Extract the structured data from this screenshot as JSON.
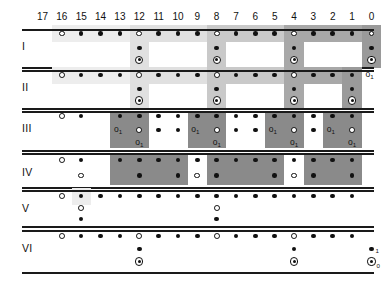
{
  "figure": {
    "title": "",
    "columns": [
      17,
      16,
      15,
      14,
      13,
      12,
      11,
      10,
      9,
      8,
      7,
      6,
      5,
      4,
      3,
      2,
      1,
      0
    ],
    "row_labels": [
      "I",
      "II",
      "III",
      "IV",
      "V",
      "VI"
    ],
    "legend_marks": {
      "filled": "•",
      "open": "○",
      "bullseye": "⊙"
    },
    "annotations": {
      "o_sub1": "o",
      "sub_1": "1",
      "sub_0": "0",
      "dot_sub1_row6": "•",
      "bull_sub0_row6": "⊙"
    },
    "colors": {
      "ink": "#111111",
      "shade_1": "#ededed",
      "shade_2": "#e0e0e0",
      "shade_3": "#c9c9c9",
      "shade_4": "#a8a8a8",
      "shade_5": "#9a9a9a",
      "shade_dark": "#8a8a8a",
      "background": "#ffffff"
    }
  },
  "rows": [
    {
      "id": "I",
      "label": "I",
      "top_dots": {
        "open_cols": [
          16,
          12,
          8,
          4,
          0
        ],
        "filled_cols": [
          15,
          14,
          13,
          11,
          10,
          9,
          7,
          6,
          5,
          3,
          2,
          1
        ]
      },
      "tails": [
        {
          "col": 12,
          "marks": [
            "filled",
            "bullseye"
          ]
        },
        {
          "col": 8,
          "marks": [
            "filled",
            "bullseye"
          ]
        },
        {
          "col": 4,
          "marks": [
            "filled",
            "bullseye"
          ]
        },
        {
          "col": 0,
          "marks": [
            "filled",
            "bullseye"
          ]
        }
      ],
      "bands": [
        {
          "from": 16,
          "to": 13,
          "shade": "shade_1"
        },
        {
          "from": 12,
          "to": 9,
          "shade": "shade_2"
        },
        {
          "from": 8,
          "to": 5,
          "shade": "shade_3"
        },
        {
          "from": 4,
          "to": 1,
          "shade": "shade_4"
        },
        {
          "from": 0,
          "to": 0,
          "shade": "shade_5"
        }
      ]
    },
    {
      "id": "II",
      "label": "II",
      "top_dots": {
        "open_cols": [
          16,
          12,
          8,
          4
        ],
        "filled_cols": [
          15,
          14,
          13,
          11,
          10,
          9,
          7,
          6,
          5,
          3,
          2,
          1
        ]
      },
      "tails": [
        {
          "col": 12,
          "marks": [
            "filled",
            "bullseye"
          ]
        },
        {
          "col": 8,
          "marks": [
            "filled",
            "bullseye"
          ]
        },
        {
          "col": 4,
          "marks": [
            "filled",
            "bullseye"
          ]
        },
        {
          "col": 1,
          "marks": [
            "filled",
            "bullseye"
          ]
        }
      ],
      "bands": [
        {
          "from": 16,
          "to": 13,
          "shade": "shade_1"
        },
        {
          "from": 12,
          "to": 9,
          "shade": "shade_2"
        },
        {
          "from": 8,
          "to": 5,
          "shade": "shade_3"
        },
        {
          "from": 4,
          "to": 2,
          "shade": "shade_4"
        },
        {
          "from": 1,
          "to": 1,
          "shade": "shade_5"
        }
      ],
      "edge_note": {
        "col": 0,
        "text": "o",
        "sub": "1"
      }
    },
    {
      "id": "III",
      "label": "III",
      "top_dots": {
        "open_cols": [
          16
        ],
        "filled_cols": [
          15,
          13,
          12,
          11,
          10,
          9,
          8,
          7,
          6,
          5,
          4,
          3,
          2,
          1
        ]
      },
      "blocks": [
        {
          "from": 13,
          "to": 12,
          "shade": "shade_dark"
        },
        {
          "from": 9,
          "to": 8,
          "shade": "shade_dark"
        },
        {
          "from": 5,
          "to": 4,
          "shade": "shade_dark"
        },
        {
          "from": 2,
          "to": 1,
          "shade": "shade_dark"
        }
      ],
      "mid_filled_cols": [
        11,
        10,
        7,
        6,
        3
      ],
      "block_marks": [
        {
          "left_col": 13,
          "right_col": 12,
          "left": "o1",
          "right": "open",
          "below": "o1"
        },
        {
          "left_col": 9,
          "right_col": 8,
          "left": "o1",
          "right": "open",
          "below": "o1"
        },
        {
          "left_col": 5,
          "right_col": 4,
          "left": "o1",
          "right": "open",
          "below": "o1"
        },
        {
          "left_col": 2,
          "right_col": 1,
          "left": "o1",
          "right": "open",
          "below": "o1"
        }
      ]
    },
    {
      "id": "IV",
      "label": "IV",
      "top_dots": {
        "open_cols": [
          16
        ],
        "filled_cols": [
          15,
          13,
          12,
          11,
          10,
          9,
          8,
          7,
          6,
          5,
          4,
          3,
          2,
          1
        ]
      },
      "blocks": [
        {
          "from": 13,
          "to": 10,
          "shade": "shade_dark"
        },
        {
          "from": 8,
          "to": 5,
          "shade": "shade_dark"
        },
        {
          "from": 3,
          "to": 1,
          "shade": "shade_dark"
        }
      ],
      "white_gap_cols": [
        9,
        4
      ],
      "lower_row": {
        "open_cols": [
          15,
          9,
          4
        ],
        "filled_cols": [
          12,
          10,
          8,
          5,
          3,
          1
        ]
      }
    },
    {
      "id": "V",
      "label": "V",
      "top_dots": {
        "open_cols": [
          16
        ],
        "filled_cols": [
          15,
          14,
          13,
          12,
          11,
          10,
          9,
          8,
          7,
          6,
          5,
          4,
          3,
          2,
          1
        ]
      },
      "tails": [
        {
          "col": 15,
          "marks": [
            "open",
            "filled"
          ]
        },
        {
          "col": 8,
          "marks": [
            "open",
            "filled"
          ]
        }
      ],
      "bands": [
        {
          "from": 15,
          "to": 15,
          "shade": "shade_1"
        }
      ]
    },
    {
      "id": "VI",
      "label": "VI",
      "top_dots": {
        "open_cols": [
          16,
          12,
          8,
          4
        ],
        "filled_cols": [
          15,
          14,
          13,
          11,
          10,
          9,
          7,
          6,
          5,
          3,
          2,
          1
        ]
      },
      "tails": [
        {
          "col": 12,
          "marks": [
            "filled",
            "bullseye"
          ]
        },
        {
          "col": 4,
          "marks": [
            "filled",
            "bullseye"
          ]
        }
      ],
      "edge_notes": [
        {
          "col": 0,
          "glyph": "•",
          "sub": "1",
          "level": 1
        },
        {
          "col": 0,
          "glyph": "⊙",
          "sub": "0",
          "level": 2
        }
      ]
    }
  ]
}
